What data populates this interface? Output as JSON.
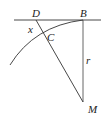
{
  "diagram": {
    "labels": {
      "D": "D",
      "B": "B",
      "C": "C",
      "x": "x",
      "r": "r",
      "M": "M"
    },
    "colors": {
      "stroke": "#333333",
      "text": "#222222",
      "background": "#ffffff"
    },
    "elements": {
      "tangent_line": "horizontal line through D and B",
      "radius": "vertical segment BM of length r",
      "secant": "line from D through C to M",
      "arc": "circular arc centered at M through B and C",
      "segment_x": "DC"
    }
  }
}
